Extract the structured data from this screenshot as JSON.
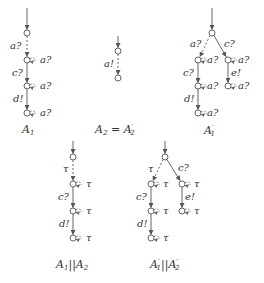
{
  "diagram": {
    "type": "automata-transition-systems",
    "automata": [
      {
        "id": "A1",
        "caption": "A",
        "caption_sub": "1",
        "caption_prime": "",
        "initial_state": "s0",
        "states": [
          "s0",
          "s1",
          "s2",
          "s3"
        ],
        "transitions": [
          {
            "from": "s0",
            "to": "s1",
            "label": "a?",
            "style": "dashed"
          },
          {
            "from": "s1",
            "to": "s2",
            "label": "c?",
            "style": "solid"
          },
          {
            "from": "s2",
            "to": "s3",
            "label": "d!",
            "style": "solid"
          }
        ],
        "self_loops": [
          {
            "state": "s1",
            "label": "a?"
          },
          {
            "state": "s2",
            "label": "a?"
          },
          {
            "state": "s3",
            "label": "a?"
          }
        ]
      },
      {
        "id": "A2",
        "caption": "A",
        "caption_sub": "2",
        "caption_rest": " = A",
        "caption_rest_sub": "2",
        "caption_rest_prime": "′",
        "initial_state": "s0",
        "states": [
          "s0",
          "s1"
        ],
        "transitions": [
          {
            "from": "s0",
            "to": "s1",
            "label": "a!",
            "style": "dashed"
          }
        ],
        "self_loops": []
      },
      {
        "id": "A1prime",
        "caption": "A",
        "caption_sub": "1",
        "caption_prime": "′",
        "initial_state": "s0",
        "states": [
          "s0",
          "s1",
          "s2",
          "s3",
          "s4",
          "s5"
        ],
        "transitions": [
          {
            "from": "s0",
            "to": "s1",
            "label": "a?",
            "style": "dashed"
          },
          {
            "from": "s0",
            "to": "s4",
            "label": "c?",
            "style": "solid"
          },
          {
            "from": "s1",
            "to": "s2",
            "label": "c?",
            "style": "solid"
          },
          {
            "from": "s2",
            "to": "s3",
            "label": "d!",
            "style": "solid"
          },
          {
            "from": "s4",
            "to": "s5",
            "label": "e!",
            "style": "solid"
          }
        ],
        "self_loops": [
          {
            "state": "s1",
            "label": "a?"
          },
          {
            "state": "s2",
            "label": "a?"
          },
          {
            "state": "s3",
            "label": "a?"
          },
          {
            "state": "s4",
            "label": "a?"
          },
          {
            "state": "s5",
            "label": "a?"
          }
        ]
      },
      {
        "id": "A1_par_A2",
        "caption": "A",
        "caption_sub": "1",
        "caption_mid": "||A",
        "caption_mid_sub": "2",
        "initial_state": "s0",
        "states": [
          "s0",
          "s1",
          "s2",
          "s3"
        ],
        "transitions": [
          {
            "from": "s0",
            "to": "s1",
            "label": "τ",
            "style": "dashed"
          },
          {
            "from": "s1",
            "to": "s2",
            "label": "c?",
            "style": "solid"
          },
          {
            "from": "s2",
            "to": "s3",
            "label": "d!",
            "style": "solid"
          }
        ],
        "self_loops": [
          {
            "state": "s1",
            "label": "τ"
          },
          {
            "state": "s2",
            "label": "τ"
          },
          {
            "state": "s3",
            "label": "τ"
          }
        ]
      },
      {
        "id": "A1prime_par_A2prime",
        "caption": "A",
        "caption_sub": "1",
        "caption_prime": "′",
        "caption_mid": "||A",
        "caption_mid_sub": "2",
        "caption_mid_prime": "′",
        "initial_state": "s0",
        "states": [
          "s0",
          "s1",
          "s2",
          "s3",
          "s4",
          "s5"
        ],
        "transitions": [
          {
            "from": "s0",
            "to": "s1",
            "label": "τ",
            "style": "dashed"
          },
          {
            "from": "s0",
            "to": "s4",
            "label": "c?",
            "style": "solid"
          },
          {
            "from": "s1",
            "to": "s2",
            "label": "c?",
            "style": "solid"
          },
          {
            "from": "s2",
            "to": "s3",
            "label": "d!",
            "style": "solid"
          },
          {
            "from": "s4",
            "to": "s5",
            "label": "e!",
            "style": "solid"
          }
        ],
        "self_loops": [
          {
            "state": "s1",
            "label": "τ"
          },
          {
            "state": "s2",
            "label": "τ"
          },
          {
            "state": "s3",
            "label": "τ"
          },
          {
            "state": "s4",
            "label": "τ"
          },
          {
            "state": "s5",
            "label": "τ"
          }
        ]
      }
    ]
  },
  "labels": {
    "a_in": "a?",
    "a_out": "a!",
    "c_in": "c?",
    "d_out": "d!",
    "e_out": "e!",
    "tau": "τ",
    "A": "A",
    "one": "1",
    "two": "2",
    "prime": "′",
    "eq": " = ",
    "par": "||"
  }
}
